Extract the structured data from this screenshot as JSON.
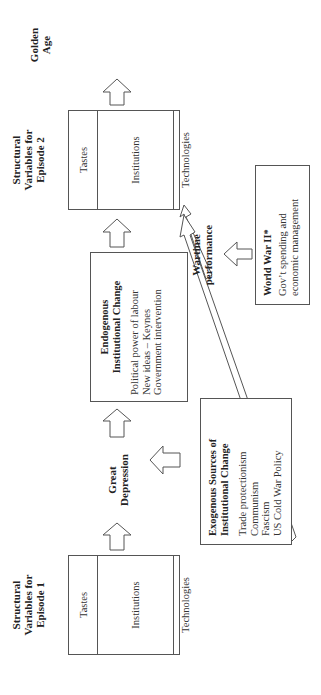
{
  "episode1": {
    "title_lines": [
      "Structural",
      "Variables for",
      "Episode 1"
    ],
    "rows": [
      "Tastes",
      "Institutions",
      "Technologies"
    ]
  },
  "great_depression": {
    "lines": [
      "Great",
      "Depression"
    ]
  },
  "endogenous": {
    "title_lines": [
      "Endogenous",
      "Institutional Change"
    ],
    "items": [
      "Political power of labour",
      "New ideas – Keynes",
      "Government intervention"
    ]
  },
  "exogenous": {
    "title_lines": [
      "Exogenous Sources of",
      "Institutional Change"
    ],
    "items": [
      "Trade protectionism",
      "Communism",
      "Fascism",
      "US Cold War Policy"
    ]
  },
  "episode2": {
    "title_lines": [
      "Structural",
      "Variables for",
      "Episode 2"
    ],
    "rows": [
      "Tastes",
      "Institutions",
      "Technologies"
    ]
  },
  "wartime": {
    "lines": [
      "Wartime",
      "performance"
    ]
  },
  "wwii": {
    "title": "World War II*",
    "items": [
      "Gov’t spending and",
      "economic management"
    ]
  },
  "golden_age": {
    "lines": [
      "Golden",
      "Age"
    ]
  },
  "colors": {
    "line": "#555555",
    "text": "#222222",
    "background": "#ffffff"
  }
}
